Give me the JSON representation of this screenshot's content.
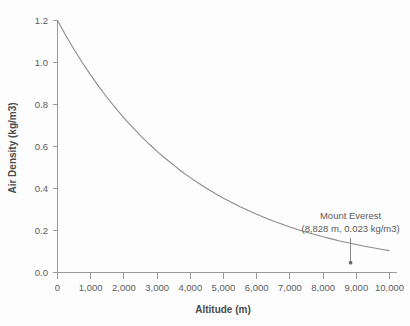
{
  "chart_data": {
    "type": "line",
    "title": "",
    "xlabel": "Altitude (m)",
    "ylabel": "Air Density (kg/m3)",
    "xlim": [
      0,
      10000
    ],
    "ylim": [
      0.0,
      1.2
    ],
    "grid": false,
    "legend": "none",
    "x_ticks": [
      {
        "value": 0,
        "label": "0"
      },
      {
        "value": 1000,
        "label": "1,000"
      },
      {
        "value": 2000,
        "label": "2,000"
      },
      {
        "value": 3000,
        "label": "3,000"
      },
      {
        "value": 4000,
        "label": "4,000"
      },
      {
        "value": 5000,
        "label": "5,000"
      },
      {
        "value": 6000,
        "label": "6,000"
      },
      {
        "value": 7000,
        "label": "7,000"
      },
      {
        "value": 8000,
        "label": "8,000"
      },
      {
        "value": 9000,
        "label": "9,000"
      },
      {
        "value": 10000,
        "label": "10,000"
      }
    ],
    "y_ticks": [
      {
        "value": 0.0,
        "label": "0.0"
      },
      {
        "value": 0.2,
        "label": "0.2"
      },
      {
        "value": 0.4,
        "label": "0.4"
      },
      {
        "value": 0.6,
        "label": "0.6"
      },
      {
        "value": 0.8,
        "label": "0.8"
      },
      {
        "value": 1.0,
        "label": "1.0"
      },
      {
        "value": 1.2,
        "label": "1.2"
      }
    ],
    "series": [
      {
        "name": "Air density vs altitude",
        "color": "#8c8c8c",
        "x": [
          0,
          250,
          500,
          750,
          1000,
          1250,
          1500,
          1750,
          2000,
          2250,
          2500,
          2750,
          3000,
          3250,
          3500,
          3750,
          4000,
          4250,
          4500,
          4750,
          5000,
          5250,
          5500,
          5750,
          6000,
          6250,
          6500,
          6750,
          7000,
          7250,
          7500,
          7750,
          8000,
          8250,
          8500,
          8750,
          9000,
          9250,
          9500,
          9750,
          10000
        ],
        "y": [
          1.2,
          1.129,
          1.062,
          0.999,
          0.94,
          0.884,
          0.832,
          0.783,
          0.736,
          0.693,
          0.652,
          0.613,
          0.577,
          0.543,
          0.511,
          0.48,
          0.452,
          0.425,
          0.4,
          0.376,
          0.354,
          0.333,
          0.313,
          0.295,
          0.277,
          0.261,
          0.245,
          0.231,
          0.217,
          0.204,
          0.192,
          0.181,
          0.17,
          0.16,
          0.15,
          0.142,
          0.133,
          0.125,
          0.118,
          0.111,
          0.104
        ]
      }
    ],
    "annotations": [
      {
        "label_line1": "Mount Everest",
        "label_line2": "(8,828 m, 0.023 kg/m3)",
        "point_x": 8828,
        "point_y": 0.023,
        "marker": "dot"
      }
    ]
  }
}
